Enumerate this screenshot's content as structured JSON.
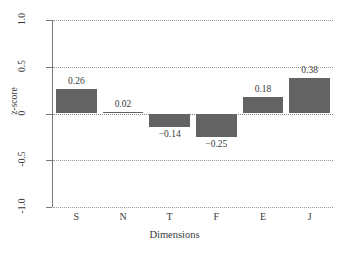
{
  "chart_data": {
    "type": "bar",
    "title": "",
    "xlabel": "Dimensions",
    "ylabel": "z-score",
    "categories": [
      "S",
      "N",
      "T",
      "F",
      "E",
      "J"
    ],
    "values": [
      0.26,
      0.02,
      -0.14,
      -0.25,
      0.18,
      0.38
    ],
    "value_labels": [
      "0.26",
      "0.02",
      "−0.14",
      "−0.25",
      "0.18",
      "0.38"
    ],
    "ylim": [
      -1.0,
      1.0
    ],
    "yticks": [
      1.0,
      0.5,
      0,
      -0.5,
      -1.0
    ],
    "ytick_labels": [
      "1.0",
      "0.5",
      "0",
      "-0.5",
      "-1.0"
    ],
    "grid": true,
    "grid_axis": "y",
    "legend": "none",
    "bar_color": "#636363",
    "grid_color": "#9a9a9a",
    "axis_color": "#777777",
    "background_color": "#ffffff"
  }
}
